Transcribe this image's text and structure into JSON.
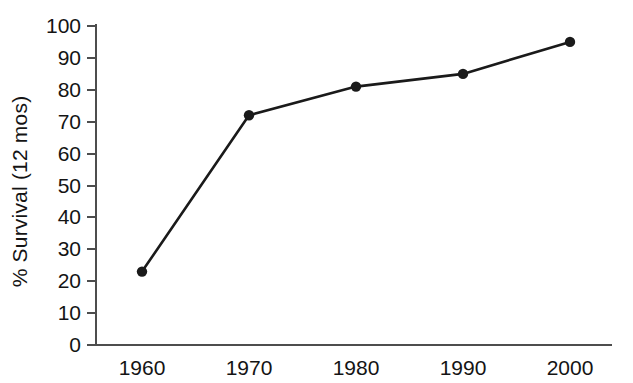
{
  "chart_data": {
    "type": "line",
    "title": "",
    "subtitle": "",
    "xlabel": "",
    "ylabel": "% Survival (12 mos)",
    "categories": [
      "1960",
      "1970",
      "1980",
      "1990",
      "2000"
    ],
    "x": [
      1960,
      1970,
      1980,
      1990,
      2000
    ],
    "values": [
      23,
      72,
      81,
      85,
      95
    ],
    "series": [
      {
        "name": "% Survival (12 mos)",
        "values": [
          23,
          72,
          81,
          85,
          95
        ]
      }
    ],
    "ylim": [
      0,
      100
    ],
    "xlim": [
      1955,
      2005
    ],
    "y_ticks": [
      0,
      10,
      20,
      30,
      40,
      50,
      60,
      70,
      80,
      90,
      100
    ],
    "y_tick_labels": [
      "0",
      "10",
      "20",
      "30",
      "40",
      "50",
      "60",
      "70",
      "80",
      "90",
      "100"
    ],
    "x_tick_labels": [
      "1960",
      "1970",
      "1980",
      "1990",
      "2000"
    ],
    "grid": false,
    "legend": false,
    "legend_position": "none",
    "marker": "circle",
    "annotations": [],
    "colors": {
      "background": "#ffffff",
      "line": "#1a1a1a",
      "marker": "#1a1a1a",
      "axis": "#4d4d4d",
      "text": "#141414"
    }
  },
  "geometry": {
    "plot_left": 96,
    "plot_right": 612,
    "plot_top": 26,
    "plot_bottom": 345,
    "tick_length": 9,
    "point_x": [
      142,
      249,
      356,
      463,
      570
    ]
  }
}
